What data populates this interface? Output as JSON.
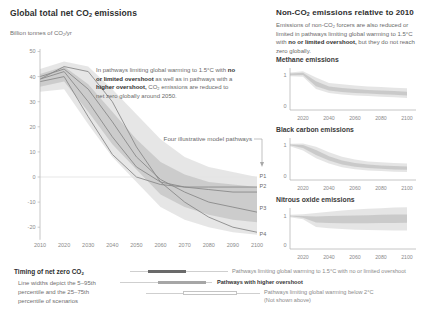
{
  "colors": {
    "band_outer": "#e2e2e2",
    "band_inner": "#c6c6c6",
    "pathway_line": "#8a8a8a",
    "axis": "#b8b8b8",
    "tick_text": "#8a8a8a",
    "zero_line": "#dcdcdc",
    "annotation_line": "#a8a8a8",
    "legend_bar_1p5": "#6a6a6a",
    "legend_bar_overshoot": "#a6a6a6",
    "legend_bar_2c_fill": "#ffffff",
    "legend_bar_2c_border": "#c4c4c4",
    "legend_thin_line": "#cfcfcf"
  },
  "left": {
    "title": {
      "pre": "Global total net CO",
      "sub": "2",
      "post": " emissions"
    },
    "y_unit": {
      "pre": "Billion tonnes of CO",
      "sub": "2",
      "post": "/yr"
    },
    "annotation": {
      "p1": "In pathways limiting global warming to 1.5°C with ",
      "b1": "no or limited overshoot",
      "p2": " as well as in pathways with a ",
      "b2": "higher overshoot,",
      "p3": " CO",
      "sub": "2",
      "p4": " emissions are reduced to net zero globally around 2050."
    },
    "pathways_label": "Four illustrative model pathways",
    "pathway_tags": [
      "P1",
      "P2",
      "P3",
      "P4"
    ]
  },
  "right": {
    "title": {
      "pre": "Non-CO",
      "sub": "2",
      "post": " emissions relative to 2010"
    },
    "intro": {
      "p1": "Emissions of non-CO",
      "sub": "2",
      "p2": " forcers are also reduced or limited in pathways limiting global warming to 1.5°C with ",
      "b1": "no or limited overshoot,",
      "p3": " but they do not reach zero globally."
    },
    "charts": [
      "Methane emissions",
      "Black carbon emissions",
      "Nitrous oxide emissions"
    ]
  },
  "legend": {
    "timing": {
      "pre": "Timing of net zero CO",
      "sub": "2"
    },
    "note": [
      "Line widths depict the 5–95th",
      "percentile and the 25–75th",
      "percentile of scenarios"
    ],
    "items": [
      {
        "label": "Pathways limiting global warming to 1.5°C with no or limited overshoot"
      },
      {
        "label": "Pathways with higher overshoot"
      },
      {
        "label": "Pathways limiting global warming below 2°C",
        "label2": "(Not shown above)"
      }
    ]
  },
  "chart_data": [
    {
      "type": "area",
      "title": "Global total net CO2 emissions",
      "ylabel": "Billion tonnes of CO2/yr",
      "xlabel": "",
      "xlim": [
        2010,
        2100
      ],
      "ylim": [
        -26,
        52
      ],
      "x": [
        2010,
        2020,
        2030,
        2040,
        2050,
        2060,
        2070,
        2080,
        2090,
        2100
      ],
      "xticks": [
        2010,
        2020,
        2030,
        2040,
        2050,
        2060,
        2070,
        2080,
        2090,
        2100
      ],
      "yticks": [
        50,
        40,
        30,
        20,
        10,
        0,
        -10,
        -20
      ],
      "band_5_95": {
        "upper": [
          43,
          46,
          44,
          35,
          25,
          15,
          8,
          4,
          2,
          0
        ],
        "lower": [
          34,
          35,
          21,
          8,
          -2,
          -12,
          -17,
          -20,
          -22,
          -23
        ]
      },
      "band_25_75": {
        "upper": [
          41,
          44,
          37,
          26,
          15,
          6,
          1,
          -2,
          -3,
          -4
        ],
        "lower": [
          36,
          38,
          26,
          13,
          3,
          -7,
          -12,
          -15,
          -17,
          -18
        ]
      },
      "series": [
        {
          "name": "P1",
          "values": [
            38,
            40,
            24,
            9,
            0,
            -3,
            -4,
            -4,
            -4,
            -4
          ]
        },
        {
          "name": "P2",
          "values": [
            39,
            42,
            30,
            16,
            4,
            -2,
            -4,
            -5,
            -6,
            -6
          ]
        },
        {
          "name": "P3",
          "values": [
            40,
            43,
            35,
            22,
            8,
            -1,
            -6,
            -10,
            -12,
            -14
          ]
        },
        {
          "name": "P4",
          "values": [
            39,
            44,
            42,
            30,
            12,
            -2,
            -10,
            -16,
            -20,
            -22
          ]
        }
      ],
      "annotations": [
        "Four illustrative model pathways",
        "P1",
        "P2",
        "P3",
        "P4"
      ]
    },
    {
      "type": "area",
      "title": "Methane emissions",
      "ylabel": "relative to 2010",
      "xlim": [
        2010,
        2100
      ],
      "ylim": [
        0,
        1.3
      ],
      "x": [
        2010,
        2020,
        2030,
        2040,
        2050,
        2060,
        2070,
        2080,
        2090,
        2100
      ],
      "xticks": [
        2020,
        2040,
        2060,
        2080,
        2100
      ],
      "yticks": [
        1,
        0
      ],
      "band_5_95": {
        "upper": [
          1.08,
          1.12,
          0.92,
          0.74,
          0.7,
          0.66,
          0.63,
          0.61,
          0.59,
          0.57
        ],
        "lower": [
          0.96,
          0.94,
          0.55,
          0.42,
          0.37,
          0.34,
          0.32,
          0.3,
          0.28,
          0.26
        ]
      },
      "band_25_75": {
        "upper": [
          1.05,
          1.07,
          0.8,
          0.63,
          0.58,
          0.55,
          0.52,
          0.5,
          0.48,
          0.46
        ],
        "lower": [
          0.99,
          1.0,
          0.64,
          0.5,
          0.45,
          0.42,
          0.4,
          0.38,
          0.36,
          0.34
        ]
      }
    },
    {
      "type": "area",
      "title": "Black carbon emissions",
      "ylabel": "relative to 2010",
      "xlim": [
        2010,
        2100
      ],
      "ylim": [
        0,
        1.3
      ],
      "x": [
        2010,
        2020,
        2030,
        2040,
        2050,
        2060,
        2070,
        2080,
        2090,
        2100
      ],
      "xticks": [
        2020,
        2040,
        2060,
        2080,
        2100
      ],
      "yticks": [
        1,
        0
      ],
      "band_5_95": {
        "upper": [
          1.04,
          1.05,
          0.94,
          0.77,
          0.62,
          0.53,
          0.47,
          0.44,
          0.42,
          0.4
        ],
        "lower": [
          0.96,
          0.82,
          0.57,
          0.4,
          0.28,
          0.22,
          0.18,
          0.16,
          0.14,
          0.13
        ]
      },
      "band_25_75": {
        "upper": [
          1.02,
          1.0,
          0.84,
          0.64,
          0.5,
          0.42,
          0.37,
          0.34,
          0.32,
          0.31
        ],
        "lower": [
          0.99,
          0.9,
          0.68,
          0.5,
          0.37,
          0.3,
          0.26,
          0.23,
          0.21,
          0.2
        ]
      }
    },
    {
      "type": "area",
      "title": "Nitrous oxide emissions",
      "ylabel": "relative to 2010",
      "xlim": [
        2010,
        2100
      ],
      "ylim": [
        0,
        1.4
      ],
      "x": [
        2010,
        2020,
        2030,
        2040,
        2050,
        2060,
        2070,
        2080,
        2090,
        2100
      ],
      "xticks": [
        2020,
        2040,
        2060,
        2080,
        2100
      ],
      "yticks": [
        1,
        0
      ],
      "band_5_95": {
        "upper": [
          1.04,
          1.06,
          1.1,
          1.15,
          1.19,
          1.22,
          1.25,
          1.27,
          1.29,
          1.3
        ],
        "lower": [
          0.96,
          0.89,
          0.62,
          0.58,
          0.55,
          0.53,
          0.52,
          0.51,
          0.5,
          0.5
        ]
      },
      "band_25_75": {
        "upper": [
          1.01,
          1.0,
          0.98,
          1.0,
          1.01,
          1.02,
          1.03,
          1.04,
          1.05,
          1.05
        ],
        "lower": [
          0.99,
          0.94,
          0.78,
          0.76,
          0.75,
          0.75,
          0.75,
          0.76,
          0.76,
          0.77
        ]
      }
    }
  ]
}
